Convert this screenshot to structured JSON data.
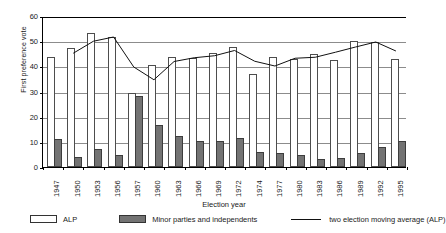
{
  "chart_data": {
    "type": "bar",
    "title": "",
    "xlabel": "Election year",
    "ylabel": "First preference vote",
    "ylim": [
      0,
      60
    ],
    "yticks": [
      0,
      10,
      20,
      30,
      40,
      50,
      60
    ],
    "grid": true,
    "legend_position": "bottom",
    "categories": [
      "1947",
      "1950",
      "1953",
      "1956",
      "1957",
      "1960",
      "1963",
      "1966",
      "1969",
      "1972",
      "1974",
      "1977",
      "1980",
      "1983",
      "1986",
      "1989",
      "1992",
      "1995"
    ],
    "series": [
      {
        "name": "ALP",
        "type": "bar",
        "color": "#ffffff",
        "values": [
          43.7,
          47.2,
          53.3,
          51.8,
          29.3,
          40.5,
          43.8,
          43.5,
          45.4,
          47.7,
          36.9,
          43.9,
          43.0,
          44.8,
          42.4,
          50.2,
          49.7,
          43.1
        ]
      },
      {
        "name": "Minor parties and independents",
        "type": "bar",
        "color": "#737373",
        "values": [
          11.3,
          4.1,
          7.1,
          4.7,
          28.4,
          16.8,
          12.5,
          10.2,
          10.2,
          11.7,
          5.8,
          5.7,
          4.7,
          3.2,
          3.5,
          5.5,
          8.1,
          10.2
        ]
      },
      {
        "name": "two election moving average (ALP)",
        "type": "line",
        "color": "#111111",
        "values": [
          null,
          45.5,
          50.3,
          52.0,
          40.0,
          34.9,
          42.2,
          43.7,
          44.5,
          46.6,
          42.3,
          40.4,
          43.5,
          43.9,
          45.9,
          48.0,
          50.0,
          46.4
        ]
      }
    ]
  },
  "legend": {
    "alp_label": "ALP",
    "minor_label": "Minor parties and independents",
    "moving_average_label": "two election moving average (ALP)"
  },
  "colors": {
    "alp_fill": "#ffffff",
    "alp_stroke": "#4d4d4d",
    "minor_fill": "#737373",
    "minor_stroke": "#3d3d3d",
    "line": "#111111",
    "grid": "#8c8c8c",
    "axis": "#000000",
    "background": "#ffffff"
  }
}
